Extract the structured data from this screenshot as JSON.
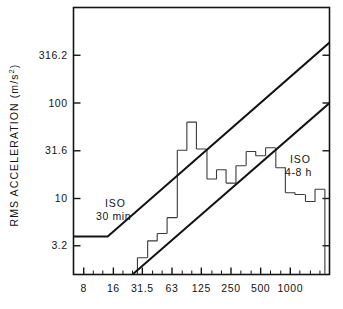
{
  "chart_data": {
    "type": "bar",
    "title": "",
    "subtitle": "",
    "xlabel": "",
    "ylabel": "RMS ACCELERATION (m/s²)",
    "ylabel_plain": "RMS ACCELERATION (m/s2)",
    "x_scale": "log",
    "y_scale": "log",
    "grid": false,
    "legend_position": "inline-annotations",
    "x_tick_labels": [
      "8",
      "16",
      "31.5",
      "63",
      "125",
      "250",
      "500",
      "1000"
    ],
    "x_tick_values": [
      8,
      16,
      31.5,
      63,
      125,
      250,
      500,
      1000
    ],
    "y_tick_labels": [
      "3.2",
      "10",
      "31.6",
      "100",
      "316.2"
    ],
    "y_tick_values": [
      3.2,
      10,
      31.6,
      100,
      316.2
    ],
    "xlim": [
      6.3,
      2500
    ],
    "ylim": [
      1.6,
      1000
    ],
    "categories": [
      "8",
      "10",
      "12.5",
      "16",
      "20",
      "25",
      "31.5",
      "40",
      "50",
      "63",
      "80",
      "100",
      "125",
      "160",
      "200",
      "250",
      "315",
      "400",
      "500",
      "630",
      "800",
      "1000",
      "1250",
      "1600",
      "2000"
    ],
    "values": [
      null,
      null,
      null,
      null,
      null,
      null,
      2.4,
      3.6,
      4.3,
      6.3,
      32.0,
      63.0,
      33.0,
      16.0,
      20.0,
      14.5,
      22.0,
      31.0,
      28.0,
      34.0,
      21.0,
      11.5,
      11.0,
      9.3,
      12.5
    ],
    "bar_style": "unfilled-outline",
    "series": [
      {
        "name": "RMS acceleration spectrum",
        "type": "bar",
        "values": [
          null,
          null,
          null,
          null,
          null,
          null,
          2.4,
          3.6,
          4.3,
          6.3,
          32.0,
          63.0,
          33.0,
          16.0,
          20.0,
          14.5,
          22.0,
          31.0,
          28.0,
          34.0,
          21.0,
          11.5,
          11.0,
          9.3,
          12.5
        ]
      },
      {
        "name": "ISO 30 min",
        "type": "line",
        "points": [
          [
            6.3,
            4.0
          ],
          [
            14.0,
            4.0
          ],
          [
            2500,
            430.0
          ]
        ]
      },
      {
        "name": "ISO 4-8 h",
        "type": "line",
        "points": [
          [
            25.0,
            1.6
          ],
          [
            2500,
            100.0
          ]
        ]
      }
    ],
    "annotations": [
      {
        "text": "ISO",
        "sub": "30 min",
        "near_x": 10.5,
        "near_y": 10.0
      },
      {
        "text": "ISO",
        "sub": "4-8 h",
        "near_x": 900,
        "near_y": 55.0
      }
    ]
  },
  "axes": {
    "y_title": "RMS ACCELERATION (m/s²)",
    "y_title_main": "RMS ACCELERATION (m/s",
    "y_title_exp": "2",
    "y_title_tail": ")",
    "y_ticks": [
      {
        "label": "316.2",
        "value": 316.2
      },
      {
        "label": "100",
        "value": 100
      },
      {
        "label": "31.6",
        "value": 31.6
      },
      {
        "label": "10",
        "value": 10
      },
      {
        "label": "3.2",
        "value": 3.2
      }
    ],
    "x_ticks": [
      {
        "label": "8",
        "value": 8
      },
      {
        "label": "16",
        "value": 16
      },
      {
        "label": "31.5",
        "value": 31.5
      },
      {
        "label": "63",
        "value": 63
      },
      {
        "label": "125",
        "value": 125
      },
      {
        "label": "250",
        "value": 250
      },
      {
        "label": "500",
        "value": 500
      },
      {
        "label": "1000",
        "value": 1000
      }
    ]
  },
  "labels": {
    "iso_30min_line1": "ISO",
    "iso_30min_line2": "30 min",
    "iso_48h_line1": "ISO",
    "iso_48h_line2": "4-8 h"
  },
  "colors": {
    "ink": "#141414",
    "paper": "#ffffff",
    "bar_stroke": "#3a3a3a",
    "axis": "#141414"
  }
}
